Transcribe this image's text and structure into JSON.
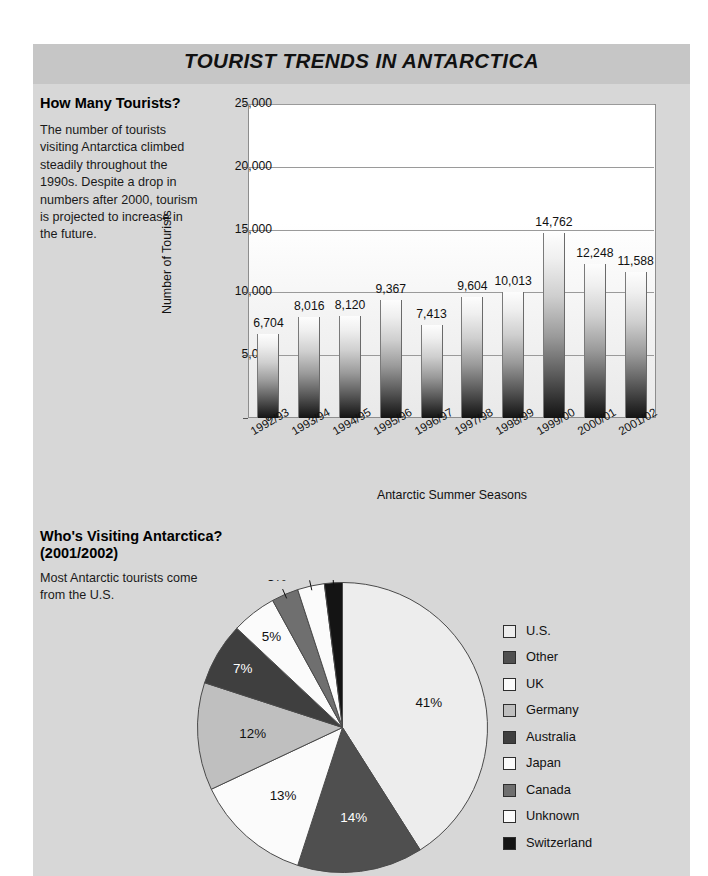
{
  "header": {
    "title": "TOURIST TRENDS IN ANTARCTICA"
  },
  "sections": {
    "bar": {
      "heading": "How Many Tourists?",
      "body": "The number of tourists visiting Antarctica climbed steadily throughout the 1990s. Despite a drop in numbers after 2000, tourism is projected to increase in the future."
    },
    "pie": {
      "heading": "Who's Visiting Antarctica? (2001/2002)",
      "body": "Most Antarctic tourists come from the U.S."
    }
  },
  "chart_data": [
    {
      "type": "bar",
      "title": "How Many Tourists?",
      "xlabel": "Antarctic Summer Seasons",
      "ylabel": "Number of Tourists",
      "ylim": [
        0,
        25000
      ],
      "yticks": [
        0,
        5000,
        10000,
        15000,
        20000,
        25000
      ],
      "ytick_labels": [
        "0",
        "5,000",
        "10,000",
        "15,000",
        "20,000",
        "25,000"
      ],
      "grid": true,
      "legend": "none",
      "categories": [
        "1992/93",
        "1993/94",
        "1994/95",
        "1995/96",
        "1996/97",
        "1997/98",
        "1998/99",
        "1999/00",
        "2000/01",
        "2001/02"
      ],
      "values": [
        6704,
        8016,
        8120,
        9367,
        7413,
        9604,
        10013,
        14762,
        12248,
        11588
      ],
      "value_labels": [
        "6,704",
        "8,016",
        "8,120",
        "9,367",
        "7,413",
        "9,604",
        "10,013",
        "14,762",
        "12,248",
        "11,588"
      ]
    },
    {
      "type": "pie",
      "title": "Who's Visiting Antarctica? (2001/2002)",
      "legend": "right",
      "start_angle_deg": 0,
      "direction": "clockwise",
      "labels": [
        "U.S.",
        "Other",
        "UK",
        "Germany",
        "Australia",
        "Japan",
        "Canada",
        "Unknown",
        "Switzerland"
      ],
      "values": [
        41,
        14,
        13,
        12,
        7,
        5,
        3,
        3,
        2
      ],
      "value_labels": [
        "41%",
        "14%",
        "13%",
        "12%",
        "7%",
        "5%",
        "3%",
        "3%",
        "2%"
      ],
      "colors": [
        "#ededed",
        "#4f4f4f",
        "#fbfbfb",
        "#bfbfbf",
        "#3f3f3f",
        "#fbfbfb",
        "#6f6f6f",
        "#fbfbfb",
        "#141414"
      ],
      "label_text_colors": [
        "#111111",
        "#ffffff",
        "#111111",
        "#111111",
        "#ffffff",
        "#111111",
        "#ffffff",
        "#111111",
        "#111111"
      ]
    }
  ],
  "legend": {
    "items": [
      {
        "label": "U.S.",
        "color": "#ededed"
      },
      {
        "label": "Other",
        "color": "#4f4f4f"
      },
      {
        "label": "UK",
        "color": "#fbfbfb"
      },
      {
        "label": "Germany",
        "color": "#bfbfbf"
      },
      {
        "label": "Australia",
        "color": "#3f3f3f"
      },
      {
        "label": "Japan",
        "color": "#fbfbfb"
      },
      {
        "label": "Canada",
        "color": "#6f6f6f"
      },
      {
        "label": "Unknown",
        "color": "#fbfbfb"
      },
      {
        "label": "Switzerland",
        "color": "#141414"
      }
    ]
  }
}
